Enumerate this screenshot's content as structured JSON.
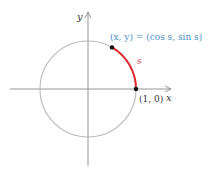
{
  "diagram": {
    "type": "unit-circle",
    "axes": {
      "x_label": "x",
      "y_label": "y"
    },
    "point_label": "(x, y) = (cos s, sin s)",
    "arc_label": "s",
    "origin_point_label": "(1, 0)",
    "colors": {
      "circle": "#b8b8b8",
      "axes": "#8a8a8a",
      "arc": "#e0282e",
      "point_label": "#4a8fc7",
      "arc_label": "#d4485a",
      "text": "#333333",
      "dot": "#111111"
    }
  }
}
